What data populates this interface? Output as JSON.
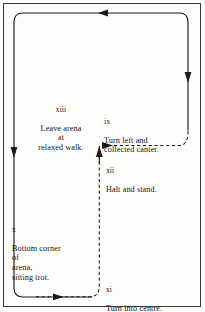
{
  "diagram": {
    "background_color": "#fdfdfb",
    "line_color": "#1a1a1a",
    "frame_color": "#3a3a3a",
    "steps": [
      {
        "id": "ix",
        "number": "ix",
        "text": "Turn left and\ncollected canter."
      },
      {
        "id": "x",
        "number": "x",
        "text": "Bottom corner\nof\narena,\nsitting trot."
      },
      {
        "id": "xi",
        "number": "xi",
        "text": "Turn into centre."
      },
      {
        "id": "xii",
        "number": "xii",
        "text": "Halt and stand."
      },
      {
        "id": "xiii",
        "number": "xiii",
        "text": "Leave arena\nat\nrelaxed walk."
      }
    ],
    "paths": {
      "solid": {
        "style": "solid",
        "description": "outer arena track"
      },
      "dashed": {
        "style": "dashed",
        "description": "inner return track to centre"
      }
    },
    "arrows": [
      {
        "name": "arrow-top-left",
        "direction": "left"
      },
      {
        "name": "arrow-right-down",
        "direction": "down"
      },
      {
        "name": "arrow-left-down",
        "direction": "down"
      },
      {
        "name": "arrow-dashed-up",
        "direction": "up"
      },
      {
        "name": "arrow-dashed-right",
        "direction": "right"
      },
      {
        "name": "arrow-bottom-right",
        "direction": "right"
      }
    ]
  }
}
